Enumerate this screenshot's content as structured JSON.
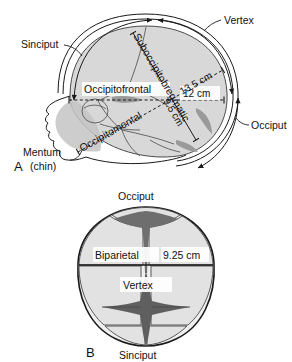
{
  "figure": {
    "panels": [
      {
        "letter": "A",
        "view": "lateral",
        "labels": {
          "sinciput": "Sinciput",
          "vertex": "Vertex",
          "occiput": "Occiput",
          "mentum_line1": "Mentum",
          "mentum_line2": "(chin)"
        },
        "diameters": [
          {
            "name": "Occipitofrontal",
            "value": "12 cm"
          },
          {
            "name": "Suboccipitobregmatic",
            "value": "9.5 cm"
          },
          {
            "name": "Occipitomental",
            "value": "13.5 cm"
          }
        ]
      },
      {
        "letter": "B",
        "view": "superior",
        "labels": {
          "occiput": "Occiput",
          "vertex": "Vertex",
          "sinciput": "Sinciput"
        },
        "diameters": [
          {
            "name": "Biparietal",
            "value": "9.25 cm"
          }
        ]
      }
    ]
  },
  "colors": {
    "ink": "#111111",
    "outline": "#1a1a1a",
    "cranium_fill": "#d8d8d8",
    "face_fill": "#c4c4c4",
    "fontanelle_fill": "#6e6e6e",
    "bone_shadow": "#9a9a9a",
    "background": "#ffffff"
  }
}
